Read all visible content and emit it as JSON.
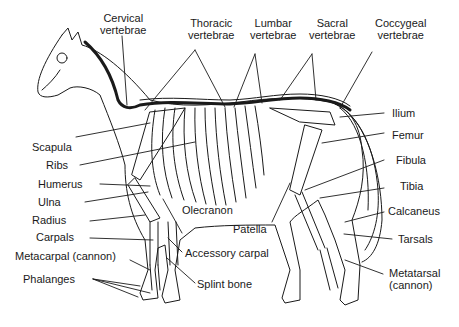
{
  "diagram": {
    "labels": {
      "cervical": [
        "Cervical",
        "vertebrae"
      ],
      "thoracic": [
        "Thoracic",
        "vertebrae"
      ],
      "lumbar": [
        "Lumbar",
        "vertebrae"
      ],
      "sacral": [
        "Sacral",
        "vertebrae"
      ],
      "coccygeal": [
        "Coccygeal",
        "vertebrae"
      ],
      "ilium": "Ilium",
      "femur": "Femur",
      "fibula": "Fibula",
      "tibia": "Tibia",
      "calcaneus": "Calcaneus",
      "tarsals": "Tarsals",
      "metatarsal": [
        "Metatarsal",
        "(cannon)"
      ],
      "patella": "Patella",
      "scapula": "Scapula",
      "ribs": "Ribs",
      "humerus": "Humerus",
      "ulna": "Ulna",
      "radius": "Radius",
      "carpals": "Carpals",
      "metacarpal": "Metacarpal (cannon)",
      "phalanges": "Phalanges",
      "olecranon": "Olecranon",
      "accessory_carpal": "Accessory carpal",
      "splint_bone": "Splint bone"
    },
    "colors": {
      "line": "#1a1a1a",
      "background": "#ffffff"
    }
  }
}
